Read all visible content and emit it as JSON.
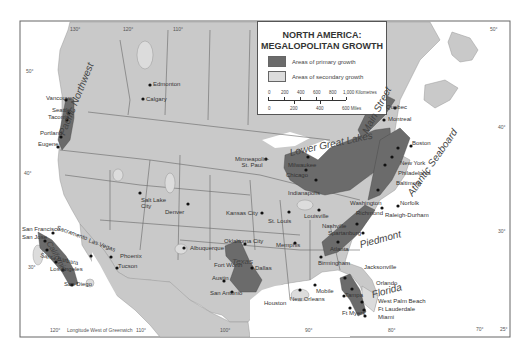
{
  "legend": {
    "title_line1": "NORTH AMERICA:",
    "title_line2": "MEGALOPOLITAN GROWTH",
    "items": [
      {
        "label": "Areas of primary growth",
        "color": "#666666"
      },
      {
        "label": "Areas of secondary growth",
        "color": "#d6d6d6"
      }
    ],
    "scale": {
      "km_ticks": [
        "0",
        "200",
        "400",
        "600",
        "800",
        "1,000 Kilometres"
      ],
      "mile_ticks": [
        "0",
        "200",
        "400",
        "600 Miles"
      ]
    }
  },
  "colors": {
    "land": "#c9c9c9",
    "water": "#ffffff",
    "primary": "#6b6b6b",
    "secondary": "#dcdcdc",
    "border": "#555555"
  },
  "regions": {
    "pacific_northwest": "Pacific Northwest",
    "california": "California",
    "texas": "Texas",
    "lower_great_lakes": "Lower Great Lakes",
    "main_street": "Main Street",
    "atlantic_seaboard": "Atlantic Seaboard",
    "piedmont": "Piedmont",
    "florida": "Florida"
  },
  "cities": {
    "vancouver": "Vancouver",
    "seattle": "Seattle",
    "tacoma": "Tacoma",
    "portland": "Portland",
    "eugene": "Eugene",
    "edmonton": "Edmonton",
    "calgary": "Calgary",
    "san_francisco": "San Francisco",
    "san_jose": "San Jose",
    "sacramento": "Sacramento",
    "santa_barbara": "Santa Barbara",
    "los_angeles": "Los Angeles",
    "san_diego": "San Diego",
    "las_vegas": "Las Vegas",
    "phoenix": "Phoenix",
    "tucson": "Tucson",
    "salt_lake_city": "Salt Lake City",
    "denver": "Denver",
    "albuquerque": "Albuquerque",
    "minneapolis": "Minneapolis-St. Paul",
    "kansas_city": "Kansas City",
    "st_louis": "St. Louis",
    "oklahoma_city": "Oklahoma City",
    "fort_worth": "Fort Worth",
    "dallas": "Dallas",
    "austin": "Austin",
    "san_antonio": "San Antonio",
    "houston": "Houston",
    "memphis": "Memphis",
    "new_orleans": "New Orleans",
    "mobile": "Mobile",
    "birmingham": "Birmingham",
    "atlanta": "Atlanta",
    "nashville": "Nashville",
    "spartanburg": "Spartanburg",
    "louisville": "Louisville",
    "indianapolis": "Indianapolis",
    "chicago": "Chicago",
    "milwaukee": "Milwaukee",
    "washington": "Washington",
    "richmond": "Richmond",
    "norfolk": "Norfolk",
    "raleigh_durham": "Raleigh-Durham",
    "baltimore": "Baltimore",
    "philadelphia": "Philadelphia",
    "new_york": "New York",
    "boston": "Boston",
    "montreal": "Montreal",
    "quebec": "Quebec",
    "jacksonville": "Jacksonville",
    "orlando": "Orlando",
    "tampa": "Tampa",
    "ft_myers": "Ft Myers",
    "west_palm_beach": "West Palm Beach",
    "ft_lauderdale": "Ft Lauderdale",
    "miami": "Miami"
  },
  "coordinates": {
    "lon_130_top": "130°",
    "lon_120_top": "120°",
    "lon_110_top": "110°",
    "lat_50_left": "50°",
    "lat_40_left": "40°",
    "lat_30_left": "30°",
    "lat_50_right": "50°",
    "lat_40_right": "40°",
    "lat_30_right": "30°",
    "lat_25_right": "25°",
    "lon_120_bottom": "120°",
    "longitude_note": "Longitude West of Greenwich",
    "lon_110_bottom": "110°",
    "lon_100_bottom": "100°",
    "lon_90_bottom": "90°",
    "lon_80_bottom": "80°",
    "lon_70_bottom": "70°"
  }
}
